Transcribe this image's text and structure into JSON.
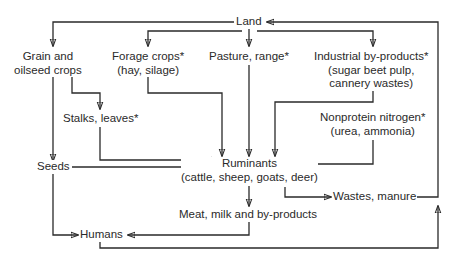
{
  "diagram": {
    "type": "flowchart",
    "title": "",
    "colors": {
      "line": "#2a2a2a",
      "text": "#2a2a2a",
      "background": "#ffffff"
    },
    "nodes": {
      "land": {
        "lines": [
          "Land"
        ]
      },
      "grain": {
        "lines": [
          "Grain and",
          "oilseed crops"
        ]
      },
      "forage": {
        "lines": [
          "Forage crops*",
          "(hay, silage)"
        ]
      },
      "pasture": {
        "lines": [
          "Pasture, range*"
        ]
      },
      "industrial": {
        "lines": [
          "Industrial by-products*",
          "(sugar beet pulp,",
          "cannery wastes)"
        ]
      },
      "stalks": {
        "lines": [
          "Stalks, leaves*"
        ]
      },
      "nonprotein": {
        "lines": [
          "Nonprotein nitrogen*",
          "(urea, ammonia)"
        ]
      },
      "seeds": {
        "lines": [
          "Seeds"
        ]
      },
      "ruminants": {
        "lines": [
          "Ruminants",
          "(cattle, sheep, goats, deer)"
        ]
      },
      "wastes": {
        "lines": [
          "Wastes, manure"
        ]
      },
      "meat": {
        "lines": [
          "Meat, milk and by-products"
        ]
      },
      "humans": {
        "lines": [
          "Humans"
        ]
      }
    },
    "edges": [
      {
        "from": "Land",
        "to": "Grain and oilseed crops"
      },
      {
        "from": "Land",
        "to": "Forage crops*"
      },
      {
        "from": "Land",
        "to": "Pasture, range*"
      },
      {
        "from": "Land",
        "to": "Industrial by-products*"
      },
      {
        "from": "Grain and oilseed crops",
        "to": "Stalks, leaves*"
      },
      {
        "from": "Grain and oilseed crops",
        "to": "Seeds"
      },
      {
        "from": "Forage crops*",
        "to": "Ruminants"
      },
      {
        "from": "Pasture, range*",
        "to": "Ruminants"
      },
      {
        "from": "Industrial by-products*",
        "to": "Ruminants"
      },
      {
        "from": "Stalks, leaves*",
        "to": "Ruminants"
      },
      {
        "from": "Seeds",
        "to": "Ruminants"
      },
      {
        "from": "Nonprotein nitrogen*",
        "to": "Ruminants"
      },
      {
        "from": "Seeds",
        "to": "Humans"
      },
      {
        "from": "Ruminants",
        "to": "Meat, milk and by-products"
      },
      {
        "from": "Ruminants",
        "to": "Wastes, manure"
      },
      {
        "from": "Meat, milk and by-products",
        "to": "Humans"
      },
      {
        "from": "Wastes, manure",
        "to": "Land"
      },
      {
        "from": "Humans",
        "to": "Land"
      }
    ]
  }
}
